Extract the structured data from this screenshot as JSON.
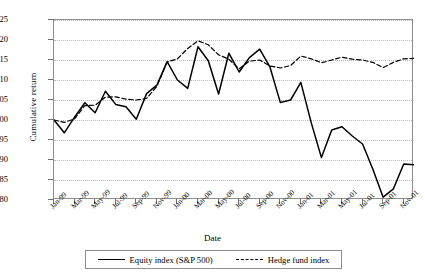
{
  "chart_data": {
    "type": "line",
    "title": "",
    "xlabel": "Date",
    "ylabel": "Cumulative return",
    "ylim": [
      80,
      125
    ],
    "ytick_labels": [
      "80",
      "85",
      "90",
      "95",
      "100",
      "105",
      "110",
      "115",
      "120",
      "125"
    ],
    "ytick_values": [
      80,
      85,
      90,
      95,
      100,
      105,
      110,
      115,
      120,
      125
    ],
    "grid": true,
    "legend_position": "bottom",
    "x": [
      "Jan-99",
      "Feb-99",
      "Mar-99",
      "Apr-99",
      "May-99",
      "Jun-99",
      "Jul-99",
      "Aug-99",
      "Sep-99",
      "Oct-99",
      "Nov-99",
      "Dec-99",
      "Jan-00",
      "Feb-00",
      "Mar-00",
      "Apr-00",
      "May-00",
      "Jun-00",
      "Jul-00",
      "Aug-00",
      "Sep-00",
      "Oct-00",
      "Nov-00",
      "Dec-00",
      "Jan-01",
      "Feb-01",
      "Mar-01",
      "Apr-01",
      "May-01",
      "Jun-01",
      "Jul-01",
      "Aug-01",
      "Sep-01",
      "Oct-01",
      "Nov-01",
      "Dec-01"
    ],
    "xtick_labels": [
      "Jan-99",
      "Mar-99",
      "May-99",
      "Jul-99",
      "Sep-99",
      "Nov-99",
      "Jan-00",
      "Mar-00",
      "May-00",
      "Jul-00",
      "Sep-00",
      "Nov-00",
      "Jan-01",
      "Mar-01",
      "May-01",
      "Jul-01",
      "Sep-01",
      "Nov-01"
    ],
    "series": [
      {
        "name": "Equity index (S&P 500)",
        "style": "solid",
        "color": "#000000",
        "values": [
          100.0,
          96.8,
          100.7,
          104.3,
          101.8,
          107.2,
          103.9,
          103.3,
          100.2,
          106.6,
          108.7,
          114.6,
          110.0,
          107.9,
          118.3,
          114.8,
          106.5,
          116.7,
          112.0,
          115.6,
          117.7,
          113.2,
          104.4,
          105.0,
          109.4,
          99.4,
          90.6,
          97.5,
          98.3,
          96.0,
          94.0,
          87.7,
          80.7,
          82.8,
          89.0,
          88.8
        ]
      },
      {
        "name": "Hedge fund index",
        "style": "dashed",
        "color": "#000000",
        "values": [
          100.0,
          99.4,
          100.3,
          103.6,
          103.7,
          105.7,
          105.8,
          105.2,
          105.0,
          105.4,
          108.4,
          114.5,
          115.3,
          117.9,
          119.8,
          118.8,
          116.3,
          115.2,
          112.8,
          114.7,
          115.0,
          113.5,
          113.0,
          113.6,
          116.0,
          115.3,
          114.3,
          115.0,
          115.7,
          115.2,
          115.0,
          114.4,
          113.1,
          114.4,
          115.3,
          115.4
        ]
      }
    ]
  },
  "legend": {
    "items": [
      {
        "label": "Equity index (S&P 500)",
        "style": "solid"
      },
      {
        "label": "Hedge fund index",
        "style": "dashed"
      }
    ]
  }
}
